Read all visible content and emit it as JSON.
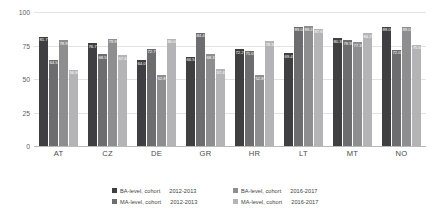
{
  "chart_data": {
    "type": "bar",
    "title": "",
    "xlabel": "",
    "ylabel": "",
    "ylim": [
      0,
      100
    ],
    "yticks": [
      "0",
      "25",
      "50",
      "75",
      "100"
    ],
    "grid": true,
    "legend_position": "bottom",
    "categories": [
      "AT",
      "CZ",
      "DE",
      "GR",
      "HR",
      "LT",
      "MT",
      "NO"
    ],
    "series": [
      {
        "name": "BA-level, cohort",
        "year": "2012-2013",
        "color": "#3f3f41",
        "values": [
          81.7,
          76.7,
          64.0,
          66.5,
          72.2,
          69.4,
          80.3,
          89.0
        ],
        "labels": [
          "81.7",
          "76.7",
          "64.0",
          "66.5",
          "72.2",
          "69.4",
          "80.3",
          "89.0"
        ]
      },
      {
        "name": "MA-level, cohort",
        "year": "2012-2013",
        "color": "#6d6d6f",
        "values": [
          64.5,
          68.5,
          72.7,
          84.4,
          71.0,
          89.0,
          78.9,
          72.0
        ],
        "labels": [
          "64.5",
          "68.5",
          "72.7",
          "84.4",
          "71.0",
          "89.0",
          "78.9",
          "72.0"
        ]
      },
      {
        "name": "BA-level, cohort",
        "year": "2016-2017",
        "color": "#8e8e90",
        "values": [
          78.9,
          79.9,
          52.8,
          68.3,
          52.8,
          89.2,
          77.3,
          89.0
        ],
        "labels": [
          "78.9",
          "79.9",
          "52.8",
          "68.3",
          "52.8",
          "89.2",
          "77.3",
          "89.0"
        ]
      },
      {
        "name": "MA-level, cohort",
        "year": "2016-2017",
        "color": "#b4b4b6",
        "values": [
          56.8,
          67.6,
          80.0,
          57.4,
          78.3,
          87.6,
          84.2,
          75.6
        ],
        "labels": [
          "56.8",
          "67.6",
          "80.0",
          "57.4",
          "78.3",
          "87.6",
          "84.2",
          "75.6"
        ]
      }
    ]
  }
}
